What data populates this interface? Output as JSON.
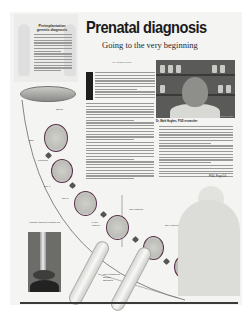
{
  "sidebar": {
    "title": "Preimplantation genetic diagnosis",
    "body_line_count": 14
  },
  "article": {
    "headline": "Prenatal diagnosis",
    "subhead": "Going to the very beginning",
    "byline": "By Richard Saltus",
    "dropcap": "F",
    "top_line_count": 10,
    "main_line_count": 28,
    "right_line_count": 19,
    "jump": "PGD, Page D4"
  },
  "photo": {
    "credit": "GLOBE STAFF PHOTO",
    "caption": "Dr. Mark Hughes, PGD researcher"
  },
  "diagram": {
    "labels": {
      "sperm": "Sperm",
      "egg": "Egg",
      "day1": "Day 1",
      "fertilized": "Fertilized",
      "day3": "Day 3",
      "eight_cell": "8-cell embryo",
      "biopsy": "Cell removed",
      "analysis": "DNA analysis",
      "implant": "Embryo implanted in uterus",
      "pipette_caption": "A pipette removes a single cell",
      "lab_test": "Cell is tested for genetic disorders"
    },
    "colors": {
      "embryo_ring": "#55304a",
      "ink": "#1a1a1a",
      "paper": "#f4f4f2"
    }
  }
}
